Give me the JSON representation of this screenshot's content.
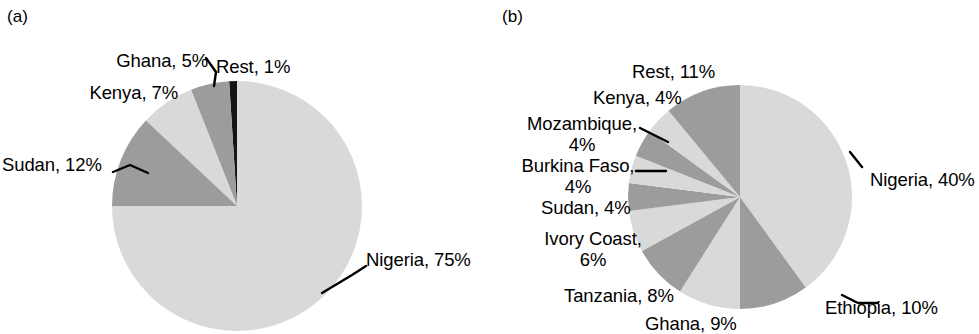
{
  "figure": {
    "background": "#ffffff",
    "width": 979,
    "height": 334
  },
  "panels": [
    {
      "id": "a",
      "label": "(a)",
      "center": [
        237,
        206
      ],
      "radius": 125,
      "chart_data": {
        "type": "pie",
        "title": "",
        "start_angle_deg": 0,
        "direction": "counterclockwise",
        "legend": "labels-with-leader-lines",
        "categories": [
          "Rest",
          "Ghana",
          "Kenya",
          "Sudan",
          "Nigeria"
        ],
        "values": [
          1,
          5,
          7,
          12,
          75
        ],
        "units": "%",
        "colors": [
          "#141414",
          "#9c9c9c",
          "#d9d9d9",
          "#9c9c9c",
          "#d9d9d9"
        ],
        "labels": [
          "Rest, 1%",
          "Ghana, 5%",
          "Kenya, 7%",
          "Sudan, 12%",
          "Nigeria, 75%"
        ]
      },
      "slice_labels": [
        {
          "text": "Ghana, 5%",
          "x": 90,
          "y": 50,
          "align": "right",
          "width": 118
        },
        {
          "text": "Rest, 1%",
          "x": 216,
          "y": 56,
          "align": "left",
          "width": 96
        },
        {
          "text": "Kenya, 7%",
          "x": 60,
          "y": 82,
          "align": "right",
          "width": 118
        },
        {
          "text": "Sudan, 12%",
          "x": 2,
          "y": 154,
          "align": "left",
          "width": 110
        },
        {
          "text": "Nigeria, 75%",
          "x": 366,
          "y": 249,
          "align": "left",
          "width": 120
        }
      ]
    },
    {
      "id": "b",
      "label": "(b)",
      "center": [
        740,
        197
      ],
      "radius": 112,
      "chart_data": {
        "type": "pie",
        "title": "",
        "start_angle_deg": 0,
        "direction": "clockwise",
        "legend": "labels-with-leader-lines",
        "categories": [
          "Nigeria",
          "Ethiopia",
          "Ghana",
          "Tanzania",
          "Ivory Coast",
          "Sudan",
          "Burkina Faso",
          "Mozambique",
          "Kenya",
          "Rest"
        ],
        "values": [
          40,
          10,
          9,
          8,
          6,
          4,
          4,
          4,
          4,
          11
        ],
        "units": "%",
        "colors": [
          "#d9d9d9",
          "#9c9c9c",
          "#d9d9d9",
          "#9c9c9c",
          "#d9d9d9",
          "#9c9c9c",
          "#d9d9d9",
          "#9c9c9c",
          "#d9d9d9",
          "#9c9c9c"
        ],
        "labels": [
          "Nigeria, 40%",
          "Ethiopia, 10%",
          "Ghana, 9%",
          "Tanzania, 8%",
          "Ivory Coast, 6%",
          "Sudan, 4%",
          "Burkina Faso, 4%",
          "Mozambique, 4%",
          "Kenya, 4%",
          "Rest, 11%"
        ]
      },
      "slice_labels": [
        {
          "text": "Rest, 11%",
          "x": 632,
          "y": 61,
          "align": "left",
          "width": 100
        },
        {
          "text": "Kenya, 4%",
          "x": 593,
          "y": 87,
          "align": "left",
          "width": 100
        },
        {
          "text": "Mozambique,\n4%",
          "x": 507,
          "y": 113,
          "align": "center",
          "width": 150
        },
        {
          "text": "Burkina Faso,\n4%",
          "x": 503,
          "y": 155,
          "align": "center",
          "width": 150
        },
        {
          "text": "Sudan, 4%",
          "x": 541,
          "y": 197,
          "align": "left",
          "width": 100
        },
        {
          "text": "Ivory Coast,\n6%",
          "x": 533,
          "y": 228,
          "align": "center",
          "width": 120
        },
        {
          "text": "Tanzania, 8%",
          "x": 564,
          "y": 285,
          "align": "left",
          "width": 125
        },
        {
          "text": "Ghana, 9%",
          "x": 645,
          "y": 313,
          "align": "left",
          "width": 110
        },
        {
          "text": "Ethiopia, 10%",
          "x": 825,
          "y": 297,
          "align": "left",
          "width": 125
        },
        {
          "text": "Nigeria, 40%",
          "x": 870,
          "y": 169,
          "align": "left",
          "width": 120
        }
      ]
    }
  ]
}
